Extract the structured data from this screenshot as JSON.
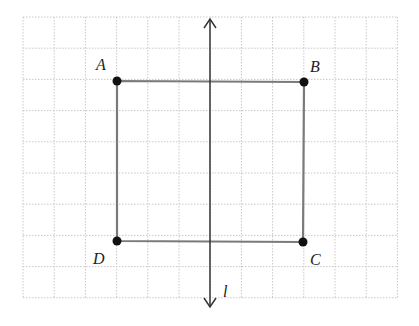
{
  "diagram": {
    "grid": {
      "x0": 23,
      "y0": 17,
      "cell": 31.2,
      "cols": 12,
      "rows": 9,
      "color": "#c8c8c8"
    },
    "square": {
      "stroke": "#7a7a7a",
      "points": {
        "A": {
          "x": 117,
          "y": 81,
          "label": "A",
          "lx": 96,
          "ly": 70
        },
        "B": {
          "x": 304,
          "y": 82,
          "label": "B",
          "lx": 310,
          "ly": 72
        },
        "C": {
          "x": 303,
          "y": 242,
          "label": "C",
          "lx": 310,
          "ly": 265
        },
        "D": {
          "x": 117,
          "y": 241,
          "label": "D",
          "lx": 93,
          "ly": 264
        }
      }
    },
    "axis": {
      "label": "l",
      "x": 210,
      "y_top": 19,
      "y_bottom": 307,
      "lx": 223,
      "ly": 297
    }
  }
}
